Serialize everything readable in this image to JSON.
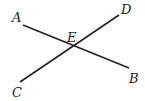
{
  "diagram": {
    "type": "intersecting-lines",
    "line_color": "#222222",
    "points": {
      "A": {
        "label": "A",
        "x": 23,
        "y": 25,
        "lx": 12,
        "ly": 22
      },
      "B": {
        "label": "B",
        "x": 129,
        "y": 68,
        "lx": 129,
        "ly": 83
      },
      "C": {
        "label": "C",
        "x": 20,
        "y": 82,
        "lx": 12,
        "ly": 97
      },
      "D": {
        "label": "D",
        "x": 119,
        "y": 15,
        "lx": 121,
        "ly": 14
      },
      "E": {
        "label": "E",
        "x": 75,
        "y": 46,
        "lx": 67,
        "ly": 42
      }
    },
    "segments": [
      {
        "name": "AB",
        "from": "A",
        "to": "B"
      },
      {
        "name": "CD",
        "from": "C",
        "to": "D"
      }
    ]
  }
}
